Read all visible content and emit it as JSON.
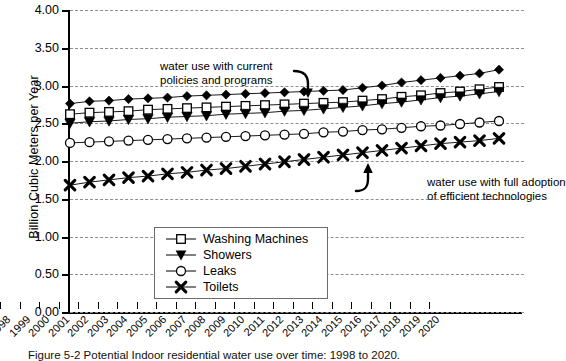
{
  "chart_data": {
    "type": "line",
    "title": "",
    "xlabel": "",
    "ylabel": "Billion Cubic Meters per Year",
    "ylim": [
      0.0,
      4.0
    ],
    "ytick_step": 0.5,
    "ytick_labels": [
      "0.00",
      "0.50",
      "1.00",
      "1.50",
      "2.00",
      "2.50",
      "3.00",
      "3.50",
      "4.00"
    ],
    "grid": "horizontal-dashed",
    "legend_position": "lower-left-inside",
    "x": [
      1998,
      1999,
      2000,
      2001,
      2002,
      2003,
      2004,
      2005,
      2006,
      2007,
      2008,
      2009,
      2010,
      2011,
      2012,
      2013,
      2014,
      2015,
      2016,
      2017,
      2018,
      2019,
      2020
    ],
    "categories": [
      "1998",
      "1999",
      "2000",
      "2001",
      "2002",
      "2003",
      "2004",
      "2005",
      "2006",
      "2007",
      "2008",
      "2009",
      "2010",
      "2011",
      "2012",
      "2013",
      "2014",
      "2015",
      "2016",
      "2017",
      "2018",
      "2019",
      "2020"
    ],
    "series": [
      {
        "name": "Current policies total",
        "marker": "filled-diamond",
        "in_legend": false,
        "values": [
          2.76,
          2.79,
          2.8,
          2.82,
          2.83,
          2.84,
          2.86,
          2.87,
          2.88,
          2.89,
          2.9,
          2.91,
          2.92,
          2.93,
          2.94,
          2.97,
          3.0,
          3.04,
          3.07,
          3.1,
          3.13,
          3.16,
          3.21
        ]
      },
      {
        "name": "Washing Machines",
        "marker": "open-square",
        "in_legend": true,
        "values": [
          2.62,
          2.64,
          2.65,
          2.66,
          2.68,
          2.69,
          2.7,
          2.71,
          2.72,
          2.73,
          2.74,
          2.75,
          2.76,
          2.77,
          2.78,
          2.8,
          2.82,
          2.85,
          2.87,
          2.9,
          2.92,
          2.95,
          2.98
        ]
      },
      {
        "name": "Showers",
        "marker": "filled-triangle-down",
        "in_legend": true,
        "values": [
          2.5,
          2.52,
          2.53,
          2.55,
          2.56,
          2.58,
          2.59,
          2.6,
          2.62,
          2.63,
          2.64,
          2.66,
          2.67,
          2.69,
          2.71,
          2.73,
          2.76,
          2.78,
          2.81,
          2.84,
          2.86,
          2.89,
          2.92
        ]
      },
      {
        "name": "Leaks",
        "marker": "open-circle",
        "in_legend": true,
        "values": [
          2.24,
          2.25,
          2.26,
          2.27,
          2.28,
          2.29,
          2.3,
          2.31,
          2.32,
          2.33,
          2.34,
          2.35,
          2.36,
          2.38,
          2.39,
          2.41,
          2.42,
          2.44,
          2.46,
          2.47,
          2.49,
          2.51,
          2.53
        ]
      },
      {
        "name": "Toilets",
        "marker": "bold-cross",
        "in_legend": true,
        "values": [
          1.68,
          1.72,
          1.75,
          1.78,
          1.8,
          1.83,
          1.85,
          1.88,
          1.9,
          1.93,
          1.96,
          1.99,
          2.02,
          2.05,
          2.08,
          2.11,
          2.14,
          2.17,
          2.2,
          2.23,
          2.25,
          2.27,
          2.3
        ]
      }
    ],
    "annotations": [
      {
        "id": "current-policies",
        "text": "water use with current\npolicies and programs",
        "points_to_series": "Current policies total",
        "arrow": "curved-hook-down"
      },
      {
        "id": "efficient-technologies",
        "text": "water use with full adoption\nof efficient technologies",
        "points_to_series": "Toilets",
        "arrow": "curved-hook-up"
      }
    ],
    "colors": {
      "line": "#000000",
      "marker_fill_open": "#ffffff",
      "marker_fill_solid": "#000000",
      "grid": "#8e8e8e",
      "axis": "#000000",
      "background": "#ffffff"
    }
  },
  "legend": {
    "entries": [
      {
        "label": "Washing Machines",
        "marker": "open-square"
      },
      {
        "label": "Showers",
        "marker": "filled-triangle-down"
      },
      {
        "label": "Leaks",
        "marker": "open-circle"
      },
      {
        "label": "Toilets",
        "marker": "bold-cross"
      }
    ]
  },
  "caption": {
    "text": "Figure 5-2    Potential Indoor residential water use over time: 1998 to 2020."
  }
}
